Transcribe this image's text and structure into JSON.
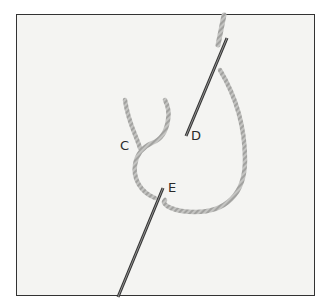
{
  "illustration": {
    "subject": "embroidery stitch diagram with needle and twisted thread on fabric",
    "labels": {
      "c": "C",
      "d": "D",
      "e": "E"
    },
    "colors": {
      "fabric": "#f4f4f2",
      "thread": "#b8b8b6",
      "needle": "#3a3a3a",
      "border": "#333333"
    }
  }
}
